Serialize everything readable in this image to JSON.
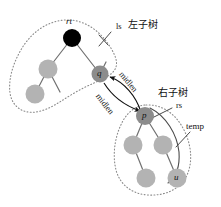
{
  "figure": {
    "type": "binary-tree-rotation-diagram",
    "background": "#ffffff",
    "ink": "#1a1a1a",
    "colors": {
      "node_black": "#000000",
      "node_gray_light": "#b3b3b3",
      "node_gray_dark": "#8c8c8c",
      "edge": "#6e6e6e",
      "dotted_outline": "#7a7a7a",
      "arrow": "#111111"
    }
  },
  "labels": {
    "rt": "rt",
    "q": "q",
    "p": "p",
    "u": "u",
    "ls": "ls",
    "left_subtree_cjk": "左子树",
    "right_subtree_cjk": "右子树",
    "rs": "rs",
    "temp": "temp",
    "midlen_upper": "midlen",
    "midlen_lower": "midlen"
  },
  "nodes": [
    {
      "id": "rt",
      "label": "rt",
      "cx": 72,
      "cy": 38,
      "r": 9,
      "fill": "#000000",
      "label_pos": "above",
      "shows_text": false
    },
    {
      "id": "l1",
      "label": "",
      "cx": 48,
      "cy": 69,
      "r": 9.5,
      "fill": "#b3b3b3",
      "label_pos": "none",
      "shows_text": false
    },
    {
      "id": "l2",
      "label": "",
      "cx": 35,
      "cy": 94,
      "r": 9.5,
      "fill": "#b3b3b3",
      "label_pos": "none",
      "shows_text": false
    },
    {
      "id": "q",
      "label": "q",
      "cx": 100,
      "cy": 74,
      "r": 8.5,
      "fill": "#8c8c8c",
      "label_pos": "inside",
      "shows_text": true
    },
    {
      "id": "p",
      "label": "p",
      "cx": 145,
      "cy": 116,
      "r": 9,
      "fill": "#8c8c8c",
      "label_pos": "inside",
      "shows_text": true
    },
    {
      "id": "r1",
      "label": "",
      "cx": 133,
      "cy": 145,
      "r": 9.5,
      "fill": "#b3b3b3",
      "label_pos": "none",
      "shows_text": false
    },
    {
      "id": "r2",
      "label": "",
      "cx": 163,
      "cy": 145,
      "r": 9.5,
      "fill": "#b3b3b3",
      "label_pos": "none",
      "shows_text": false
    },
    {
      "id": "r3",
      "label": "",
      "cx": 146,
      "cy": 178,
      "r": 9.5,
      "fill": "#b3b3b3",
      "label_pos": "none",
      "shows_text": false
    },
    {
      "id": "u",
      "label": "u",
      "cx": 177,
      "cy": 178,
      "r": 9.5,
      "fill": "#b3b3b3",
      "label_pos": "inside",
      "shows_text": true
    }
  ],
  "edges": [
    {
      "from": "rt",
      "to": "l1"
    },
    {
      "from": "rt",
      "to": "q"
    },
    {
      "from": "l1",
      "to": "l2"
    },
    {
      "from": "l1",
      "to": "stub-l1"
    },
    {
      "from": "q",
      "to": "stub-q"
    },
    {
      "from": "p",
      "to": "r1"
    },
    {
      "from": "p",
      "to": "r2"
    },
    {
      "from": "r1",
      "to": "r3"
    },
    {
      "from": "r2",
      "to": "u"
    }
  ],
  "arrows": [
    {
      "name": "midlen-upper",
      "label": "midlen",
      "from": "p",
      "to": "q",
      "style": "curved"
    },
    {
      "name": "midlen-lower",
      "label": "midlen",
      "from": "q",
      "to": "p",
      "style": "curved"
    }
  ],
  "outlines": [
    {
      "name": "left-subtree-outline",
      "style": "dotted",
      "label": "ls 左子树"
    },
    {
      "name": "right-subtree-outline",
      "style": "dotted",
      "label": "右子树 rs"
    },
    {
      "name": "temp-outline",
      "style": "solid",
      "label": "temp"
    }
  ]
}
